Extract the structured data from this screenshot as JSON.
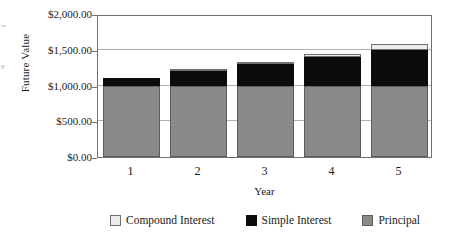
{
  "chart_data": {
    "type": "bar",
    "subtype": "stacked",
    "title": "",
    "xlabel": "Year",
    "ylabel": "Future Value",
    "categories": [
      "1",
      "2",
      "3",
      "4",
      "5"
    ],
    "ylim": [
      0,
      2000
    ],
    "yticks": [
      0,
      500,
      1000,
      1500,
      2000
    ],
    "ytick_labels": [
      "$0.00",
      "$500.00",
      "$1,000.00",
      "$1,500.00",
      "$2,000.00"
    ],
    "grid": true,
    "legend_position": "bottom",
    "series": [
      {
        "name": "Principal",
        "color": "#8a8a8a",
        "values": [
          1000,
          1000,
          1000,
          1000,
          1000
        ]
      },
      {
        "name": "Simple Interest",
        "color": "#0c0c0c",
        "values": [
          100,
          200,
          300,
          400,
          500
        ]
      },
      {
        "name": "Compound Interest",
        "color": "#ececec",
        "values": [
          0,
          10,
          25,
          46,
          76
        ]
      }
    ],
    "totals": [
      1100,
      1210,
      1325,
      1446,
      1576
    ]
  },
  "axes": {
    "y_title": "Future Value",
    "x_title": "Year"
  },
  "legend": {
    "items": [
      {
        "label": "Compound Interest",
        "swatch": "compound-swatch"
      },
      {
        "label": "Simple Interest",
        "swatch": "simple-swatch"
      },
      {
        "label": "Principal",
        "swatch": "principal-swatch"
      }
    ]
  },
  "artifacts": {
    "edge_text_1": "=",
    "edge_text_2": "e"
  }
}
